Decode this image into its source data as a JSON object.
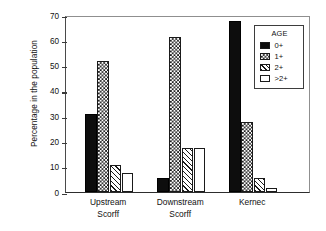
{
  "chart_data": {
    "type": "bar",
    "title": "",
    "subtitle": "",
    "xlabel": "",
    "ylabel": "Percentage in the population",
    "categories": [
      "Upstream\nScorff",
      "Downstream\nScorff",
      "Kernec"
    ],
    "series": [
      {
        "name": "0+",
        "swatch": "solid-black",
        "values": [
          31.0,
          5.5,
          67.5
        ]
      },
      {
        "name": "1+",
        "swatch": "checkerboard",
        "values": [
          52.0,
          61.5,
          27.5
        ]
      },
      {
        "name": "2+",
        "swatch": "diagonal-hatch",
        "values": [
          10.5,
          17.5,
          5.5
        ]
      },
      {
        "name": ">2+",
        "swatch": "white-empty",
        "values": [
          7.5,
          17.5,
          1.5
        ]
      }
    ],
    "ylim": [
      0,
      70
    ],
    "yticks": [
      0,
      10,
      20,
      30,
      40,
      50,
      60,
      70
    ],
    "ytick_labels": [
      "0",
      "10",
      "20",
      "30",
      "40",
      "50",
      "60",
      "70"
    ],
    "grid": false,
    "legend": {
      "title": "AGE",
      "position": "inside-top-right",
      "entries": [
        "0+",
        "1+",
        "2+",
        ">2+"
      ]
    },
    "colors": {
      "foreground": "#1a1a1a",
      "background": "#ffffff",
      "axis": "#3a3a3a"
    }
  }
}
